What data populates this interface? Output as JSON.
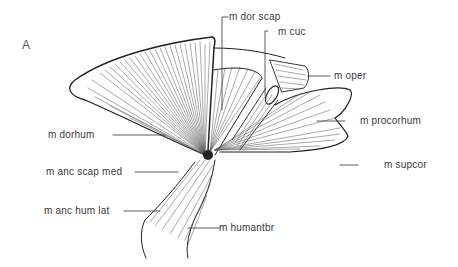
{
  "figure": {
    "panel_label": "A",
    "labels": {
      "dor_scap": "m dor scap",
      "cuc": "m cuc",
      "oper": "m oper",
      "procorhum": "m procorhum",
      "dorhum": "m dorhum",
      "anc_scap_med": "m anc scap med",
      "supcor": "m supcor",
      "anc_hum_lat": "m anc hum lat",
      "humantbr": "m humantbr"
    }
  }
}
